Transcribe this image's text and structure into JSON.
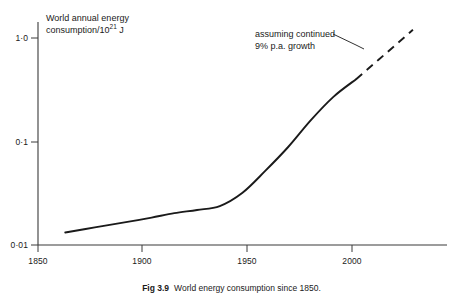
{
  "figure": {
    "caption_label": "Fig 3.9",
    "caption_text": "World energy consumption since 1850."
  },
  "chart_data": {
    "type": "line",
    "title": "",
    "ylabel_line1": "World annual energy",
    "ylabel_line2_prefix": "consumption/10",
    "ylabel_line2_sup": "21",
    "ylabel_line2_suffix": " J",
    "xlabel": "",
    "yscale": "log",
    "xlim": [
      1850,
      2030
    ],
    "ylim": [
      0.01,
      1.4
    ],
    "grid": false,
    "legend": "none",
    "xticks": [
      1850,
      1900,
      1950,
      2000
    ],
    "xtick_labels": [
      "1850",
      "1900",
      "1950",
      "2000"
    ],
    "yticks": [
      0.01,
      0.1,
      1.0
    ],
    "ytick_labels": [
      "0·01",
      "0·1",
      "1·0"
    ],
    "series": [
      {
        "name": "historical",
        "style": "solid",
        "x": [
          1862,
          1875,
          1890,
          1900,
          1910,
          1920,
          1930,
          1940,
          1950,
          1960,
          1970,
          1980,
          1990
        ],
        "y": [
          0.0132,
          0.0148,
          0.0168,
          0.0184,
          0.0203,
          0.0218,
          0.0238,
          0.032,
          0.052,
          0.088,
          0.16,
          0.27,
          0.4
        ]
      },
      {
        "name": "projection",
        "style": "dashed",
        "x": [
          1990,
          2000,
          2008,
          2015
        ],
        "y": [
          0.4,
          0.62,
          0.88,
          1.2
        ]
      }
    ],
    "annotations": [
      {
        "text_line1": "assuming continued",
        "text_line2": "9% p.a. growth",
        "points_to_series": "projection"
      }
    ]
  }
}
